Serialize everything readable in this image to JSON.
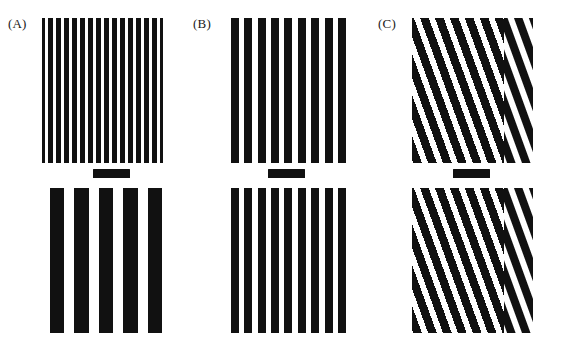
{
  "figure": {
    "width": 562,
    "height": 342,
    "background_color": "#ffffff",
    "stripe_color": "#111111",
    "gap_color": "#ffffff"
  },
  "panels": [
    {
      "id": "A",
      "label": "(A)",
      "label_x": 8,
      "label_y": 16,
      "left": 42,
      "top_patch": {
        "name": "panel-a-top-grating",
        "x": 42,
        "y": 18,
        "width": 121,
        "height": 145,
        "orientation_deg": 0,
        "stripe_period_px": 8,
        "stripe_width_px": 4.6,
        "stripe_count": 15,
        "phase_offset_px": 0,
        "discontinuity": false
      },
      "bottom_patch": {
        "name": "panel-a-bottom-grating",
        "x": 42,
        "y": 188,
        "width": 121,
        "height": 145,
        "orientation_deg": 0,
        "stripe_period_px": 24.5,
        "stripe_width_px": 14,
        "stripe_count": 5,
        "phase_offset_px": 0,
        "discontinuity": false
      },
      "fixation_bar": {
        "name": "panel-a-fixation-bar",
        "x": 93,
        "y": 169,
        "width": 37,
        "height": 9
      }
    },
    {
      "id": "B",
      "label": "(B)",
      "label_x": 193,
      "label_y": 16,
      "left": 227,
      "top_patch": {
        "name": "panel-b-top-grating",
        "x": 227,
        "y": 18,
        "width": 121,
        "height": 145,
        "orientation_deg": 0,
        "stripe_period_px": 13.4,
        "stripe_width_px": 8,
        "stripe_count": 9,
        "phase_offset_px": 0,
        "discontinuity": false
      },
      "bottom_patch": {
        "name": "panel-b-bottom-grating",
        "x": 227,
        "y": 188,
        "width": 121,
        "height": 145,
        "orientation_deg": 0,
        "stripe_period_px": 13.4,
        "stripe_width_px": 8,
        "stripe_count": 9,
        "phase_offset_px": 0,
        "discontinuity": false
      },
      "fixation_bar": {
        "name": "panel-b-fixation-bar",
        "x": 268,
        "y": 169,
        "width": 37,
        "height": 9
      }
    },
    {
      "id": "C",
      "label": "(C)",
      "label_x": 378,
      "label_y": 16,
      "left": 412,
      "top_patch": {
        "name": "panel-c-top-grating",
        "x": 412,
        "y": 18,
        "width": 121,
        "height": 145,
        "orientation_deg": 20,
        "stripe_period_px": 14,
        "stripe_width_px": 8.2,
        "stripe_count": 11,
        "phase_offset_px": 0,
        "discontinuity": true,
        "discontinuity_x_px": 92,
        "discontinuity_shift_px": 7
      },
      "bottom_patch": {
        "name": "panel-c-bottom-grating",
        "x": 412,
        "y": 188,
        "width": 121,
        "height": 145,
        "orientation_deg": 20,
        "stripe_period_px": 14,
        "stripe_width_px": 8.2,
        "stripe_count": 11,
        "phase_offset_px": 0,
        "discontinuity": true,
        "discontinuity_x_px": 92,
        "discontinuity_shift_px": 7
      },
      "fixation_bar": {
        "name": "panel-c-fixation-bar",
        "x": 453,
        "y": 169,
        "width": 37,
        "height": 9
      }
    }
  ]
}
